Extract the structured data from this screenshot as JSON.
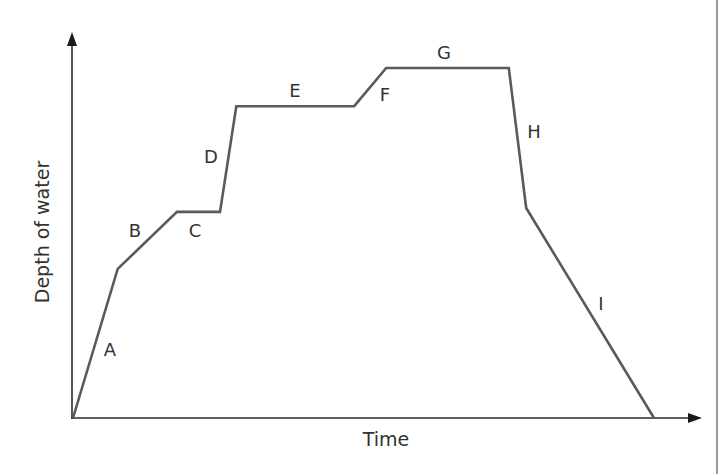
{
  "chart_data": {
    "type": "line",
    "title": "",
    "xlabel": "Time",
    "ylabel": "Depth of water",
    "xlim": [
      0,
      100
    ],
    "ylim": [
      0,
      100
    ],
    "grid": false,
    "legend": null,
    "axis_ticks": "none",
    "series": [
      {
        "name": "Depth of water",
        "color": "#5a5a5a",
        "x": [
          0,
          7.7,
          17.9,
          25.3,
          28.1,
          48.4,
          53.9,
          75.0,
          78.0,
          100
        ],
        "y": [
          0,
          42.6,
          58.9,
          58.9,
          89.1,
          89.1,
          100,
          100,
          60.0,
          0
        ]
      }
    ],
    "segments": [
      {
        "label": "A",
        "from": [
          0,
          0
        ],
        "to": [
          7.7,
          42.6
        ],
        "trend": "rising steeply"
      },
      {
        "label": "B",
        "from": [
          7.7,
          42.6
        ],
        "to": [
          17.9,
          58.9
        ],
        "trend": "rising gently"
      },
      {
        "label": "C",
        "from": [
          17.9,
          58.9
        ],
        "to": [
          25.3,
          58.9
        ],
        "trend": "constant"
      },
      {
        "label": "D",
        "from": [
          25.3,
          58.9
        ],
        "to": [
          28.1,
          89.1
        ],
        "trend": "rising very steeply"
      },
      {
        "label": "E",
        "from": [
          28.1,
          89.1
        ],
        "to": [
          48.4,
          89.1
        ],
        "trend": "constant"
      },
      {
        "label": "F",
        "from": [
          48.4,
          89.1
        ],
        "to": [
          53.9,
          100
        ],
        "trend": "rising"
      },
      {
        "label": "G",
        "from": [
          53.9,
          100
        ],
        "to": [
          75.0,
          100
        ],
        "trend": "constant"
      },
      {
        "label": "H",
        "from": [
          75.0,
          100
        ],
        "to": [
          78.0,
          60.0
        ],
        "trend": "falling steeply"
      },
      {
        "label": "I",
        "from": [
          78.0,
          60.0
        ],
        "to": [
          100,
          0
        ],
        "trend": "falling gradually"
      }
    ],
    "annotations": [
      "A",
      "B",
      "C",
      "D",
      "E",
      "F",
      "G",
      "H",
      "I"
    ]
  },
  "labels": {
    "x_axis": "Time",
    "y_axis": "Depth of water",
    "segments": {
      "A": "A",
      "B": "B",
      "C": "C",
      "D": "D",
      "E": "E",
      "F": "F",
      "G": "G",
      "H": "H",
      "I": "I"
    }
  }
}
